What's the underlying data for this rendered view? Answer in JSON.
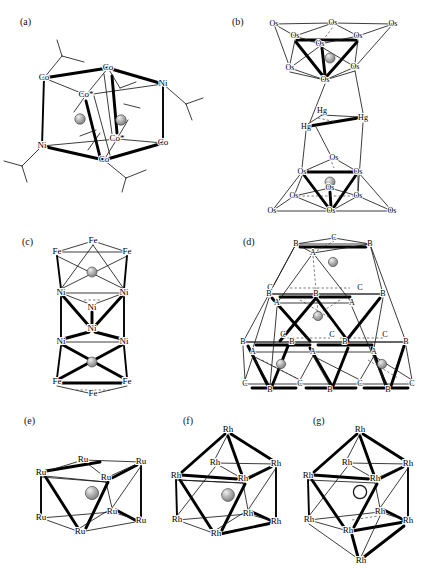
{
  "figure": {
    "background_color": "#ffffff",
    "line_color": "#000000",
    "sphere_fill": "#9a9a9a",
    "sphere_highlight": "#e8e8e8"
  },
  "panels": [
    {
      "id": "a",
      "tag": "(a)",
      "tag_x": 20,
      "tag_y": 16,
      "shape": "hexagonal-prism",
      "interstitial_count": 2,
      "vertices": [
        {
          "label": "Co",
          "x": 44,
          "y": 78
        },
        {
          "label": "Co",
          "x": 108,
          "y": 68
        },
        {
          "label": "Ni",
          "x": 163,
          "y": 84
        },
        {
          "label": "Ni",
          "x": 42,
          "y": 146
        },
        {
          "label": "Co",
          "x": 104,
          "y": 160
        },
        {
          "label": "Co",
          "x": 163,
          "y": 143
        },
        {
          "label": "Co*",
          "x": 86,
          "y": 95
        },
        {
          "label": "Co*",
          "x": 117,
          "y": 139
        }
      ],
      "interstitials": [
        {
          "x": 80,
          "y": 119,
          "r": 5.2,
          "open": false
        },
        {
          "x": 121,
          "y": 120,
          "r": 5.2,
          "open": false
        }
      ]
    },
    {
      "id": "b",
      "tag": "(b)",
      "tag_x": 232,
      "tag_y": 16,
      "shape": "two-octahedra-bridged-by-Hg3",
      "interstitial_count": 2,
      "vertices": [
        {
          "label": "Os",
          "x": 274,
          "y": 24
        },
        {
          "label": "Os",
          "x": 333,
          "y": 23
        },
        {
          "label": "Os",
          "x": 393,
          "y": 24
        },
        {
          "label": "Os",
          "x": 295,
          "y": 36
        },
        {
          "label": "Os",
          "x": 358,
          "y": 36
        },
        {
          "label": "Os",
          "x": 320,
          "y": 44
        },
        {
          "label": "Os",
          "x": 290,
          "y": 68
        },
        {
          "label": "Os",
          "x": 355,
          "y": 67
        },
        {
          "label": "Os",
          "x": 325,
          "y": 80
        },
        {
          "label": "Hg",
          "x": 322,
          "y": 111
        },
        {
          "label": "Hg",
          "x": 306,
          "y": 127
        },
        {
          "label": "Hg",
          "x": 363,
          "y": 118
        },
        {
          "label": "Os",
          "x": 334,
          "y": 158
        },
        {
          "label": "Os",
          "x": 302,
          "y": 172
        },
        {
          "label": "Os",
          "x": 358,
          "y": 172
        },
        {
          "label": "Os",
          "x": 330,
          "y": 188
        },
        {
          "label": "Os",
          "x": 294,
          "y": 196
        },
        {
          "label": "Os",
          "x": 358,
          "y": 196
        },
        {
          "label": "Os",
          "x": 272,
          "y": 211
        },
        {
          "label": "Os",
          "x": 331,
          "y": 211
        },
        {
          "label": "Os",
          "x": 392,
          "y": 211
        }
      ],
      "interstitials": [
        {
          "x": 330,
          "y": 58,
          "r": 5.0,
          "open": false
        },
        {
          "x": 330,
          "y": 182,
          "r": 5.0,
          "open": false
        }
      ]
    },
    {
      "id": "c",
      "tag": "(c)",
      "tag_x": 22,
      "tag_y": 236,
      "shape": "stacked-antiprism-column",
      "interstitial_count": 2,
      "vertices": [
        {
          "label": "Fe",
          "x": 93,
          "y": 241
        },
        {
          "label": "Fe",
          "x": 57,
          "y": 252
        },
        {
          "label": "Fe",
          "x": 127,
          "y": 252
        },
        {
          "label": "Ni",
          "x": 61,
          "y": 293
        },
        {
          "label": "Ni",
          "x": 124,
          "y": 293
        },
        {
          "label": "Ni",
          "x": 92,
          "y": 308
        },
        {
          "label": "Ni",
          "x": 92,
          "y": 329
        },
        {
          "label": "Ni",
          "x": 61,
          "y": 342
        },
        {
          "label": "Ni",
          "x": 124,
          "y": 342
        },
        {
          "label": "Fe",
          "x": 57,
          "y": 382
        },
        {
          "label": "Fe",
          "x": 127,
          "y": 382
        },
        {
          "label": "Fe",
          "x": 93,
          "y": 394
        }
      ],
      "interstitials": [
        {
          "x": 92,
          "y": 272,
          "r": 5.0,
          "open": false
        },
        {
          "x": 92,
          "y": 362,
          "r": 5.0,
          "open": false
        }
      ]
    },
    {
      "id": "d",
      "tag": "(d)",
      "tag_x": 243,
      "tag_y": 236,
      "shape": "close-packed-ABC-tetrahedral-stack",
      "interstitial_count": 4,
      "vertices": [
        {
          "label": "C",
          "x": 334,
          "y": 238
        },
        {
          "label": "B",
          "x": 296,
          "y": 244
        },
        {
          "label": "B",
          "x": 370,
          "y": 244
        },
        {
          "label": "A",
          "x": 313,
          "y": 253
        },
        {
          "label": "C",
          "x": 270,
          "y": 288
        },
        {
          "label": "C",
          "x": 360,
          "y": 288
        },
        {
          "label": "B",
          "x": 269,
          "y": 294
        },
        {
          "label": "B",
          "x": 316,
          "y": 294
        },
        {
          "label": "B",
          "x": 383,
          "y": 294
        },
        {
          "label": "A",
          "x": 277,
          "y": 303
        },
        {
          "label": "A",
          "x": 352,
          "y": 303
        },
        {
          "label": "C",
          "x": 283,
          "y": 335
        },
        {
          "label": "C",
          "x": 332,
          "y": 335
        },
        {
          "label": "C",
          "x": 385,
          "y": 335
        },
        {
          "label": "B",
          "x": 243,
          "y": 342
        },
        {
          "label": "B",
          "x": 292,
          "y": 342
        },
        {
          "label": "B",
          "x": 345,
          "y": 342
        },
        {
          "label": "B",
          "x": 406,
          "y": 342
        },
        {
          "label": "A",
          "x": 253,
          "y": 352
        },
        {
          "label": "A",
          "x": 313,
          "y": 352
        },
        {
          "label": "A",
          "x": 374,
          "y": 352
        },
        {
          "label": "C",
          "x": 245,
          "y": 384
        },
        {
          "label": "C",
          "x": 300,
          "y": 384
        },
        {
          "label": "C",
          "x": 360,
          "y": 384
        },
        {
          "label": "C",
          "x": 412,
          "y": 384
        },
        {
          "label": "B",
          "x": 270,
          "y": 390
        },
        {
          "label": "B",
          "x": 330,
          "y": 390
        },
        {
          "label": "B",
          "x": 388,
          "y": 390
        }
      ],
      "interstitials": [
        {
          "x": 333,
          "y": 262,
          "r": 4.6,
          "open": false
        },
        {
          "x": 318,
          "y": 316,
          "r": 4.6,
          "open": false
        },
        {
          "x": 281,
          "y": 364,
          "r": 4.6,
          "open": false
        },
        {
          "x": 382,
          "y": 364,
          "r": 4.6,
          "open": false
        }
      ]
    },
    {
      "id": "e",
      "tag": "(e)",
      "tag_x": 24,
      "tag_y": 415,
      "shape": "cube",
      "interstitial_count": 1,
      "vertices": [
        {
          "label": "Ru",
          "x": 83,
          "y": 460
        },
        {
          "label": "Ru",
          "x": 141,
          "y": 462
        },
        {
          "label": "Ru",
          "x": 41,
          "y": 473
        },
        {
          "label": "Ru",
          "x": 106,
          "y": 478
        },
        {
          "label": "Ru",
          "x": 112,
          "y": 512
        },
        {
          "label": "Ru",
          "x": 41,
          "y": 518
        },
        {
          "label": "Ru",
          "x": 141,
          "y": 521
        },
        {
          "label": "Ru",
          "x": 80,
          "y": 532
        }
      ],
      "interstitials": [
        {
          "x": 92,
          "y": 493,
          "r": 6.6,
          "open": false
        }
      ]
    },
    {
      "id": "f",
      "tag": "(f)",
      "tag_x": 183,
      "tag_y": 415,
      "shape": "capped-square-antiprism",
      "interstitial_count": 1,
      "vertices": [
        {
          "label": "Rh",
          "x": 228,
          "y": 430
        },
        {
          "label": "Rh",
          "x": 215,
          "y": 463
        },
        {
          "label": "Rh",
          "x": 276,
          "y": 464
        },
        {
          "label": "Rh",
          "x": 176,
          "y": 476
        },
        {
          "label": "Rh",
          "x": 243,
          "y": 479
        },
        {
          "label": "Rh",
          "x": 248,
          "y": 514
        },
        {
          "label": "Rh",
          "x": 177,
          "y": 520
        },
        {
          "label": "Rh",
          "x": 276,
          "y": 522
        },
        {
          "label": "Rh",
          "x": 216,
          "y": 534
        }
      ],
      "interstitials": [
        {
          "x": 228,
          "y": 495,
          "r": 6.4,
          "open": false
        }
      ]
    },
    {
      "id": "g",
      "tag": "(g)",
      "tag_x": 313,
      "tag_y": 415,
      "shape": "bicapped-square-antiprism",
      "interstitial_count": 1,
      "vertices": [
        {
          "label": "Rh",
          "x": 360,
          "y": 430
        },
        {
          "label": "Rh",
          "x": 347,
          "y": 463
        },
        {
          "label": "Rh",
          "x": 408,
          "y": 464
        },
        {
          "label": "Rh",
          "x": 308,
          "y": 476
        },
        {
          "label": "Rh",
          "x": 375,
          "y": 479
        },
        {
          "label": "Rh",
          "x": 380,
          "y": 512
        },
        {
          "label": "Rh",
          "x": 309,
          "y": 520
        },
        {
          "label": "Rh",
          "x": 408,
          "y": 521
        },
        {
          "label": "Rh",
          "x": 348,
          "y": 531
        },
        {
          "label": "Rh",
          "x": 361,
          "y": 561
        }
      ],
      "interstitials": [
        {
          "x": 360,
          "y": 492,
          "r": 6.6,
          "open": true
        }
      ]
    }
  ]
}
